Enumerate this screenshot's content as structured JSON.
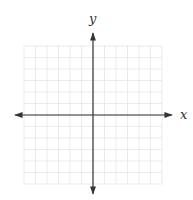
{
  "chart_data": {
    "type": "coordinate-grid",
    "title": "",
    "xlabel": "x",
    "ylabel": "y",
    "grid": true,
    "grid_columns": 12,
    "grid_rows": 12,
    "x_range": [
      -6,
      6
    ],
    "y_range": [
      -6,
      6
    ],
    "tick_labels": [],
    "series": [],
    "axes_arrows": "both ends",
    "colors": {
      "axis": "#333333",
      "grid": "#e6e6e6",
      "background": "#ffffff"
    }
  },
  "labels": {
    "x_axis": "x",
    "y_axis": "y"
  }
}
